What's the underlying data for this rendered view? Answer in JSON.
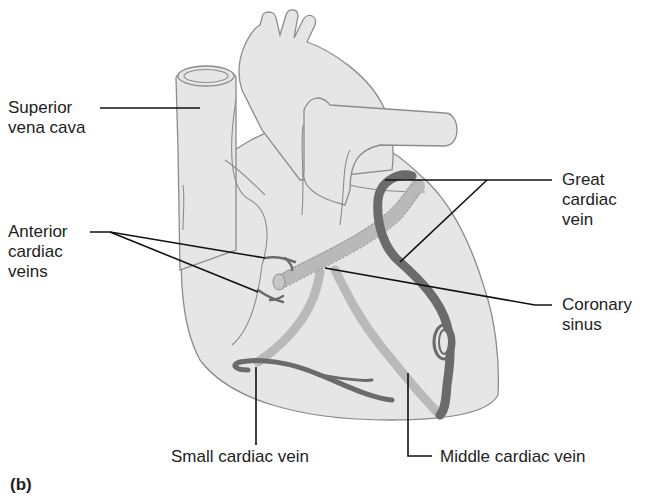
{
  "figure": {
    "panel_letter": "(b)",
    "colors": {
      "heart_fill": "#e6e6e6",
      "heart_outline": "#8c8c8c",
      "dark_vein": "#6b6b6b",
      "light_vein": "#b9b9b9",
      "leader_line": "#111111",
      "text": "#222222"
    }
  },
  "labels": {
    "superior_vena_cava": {
      "line1": "Superior",
      "line2": "vena cava"
    },
    "anterior_cardiac_veins": {
      "line1": "Anterior",
      "line2": "cardiac",
      "line3": "veins"
    },
    "great_cardiac_vein": {
      "line1": "Great",
      "line2": "cardiac",
      "line3": "vein"
    },
    "coronary_sinus": {
      "line1": "Coronary",
      "line2": "sinus"
    },
    "small_cardiac_vein": {
      "line1": "Small cardiac vein"
    },
    "middle_cardiac_vein": {
      "line1": "Middle cardiac vein"
    }
  }
}
